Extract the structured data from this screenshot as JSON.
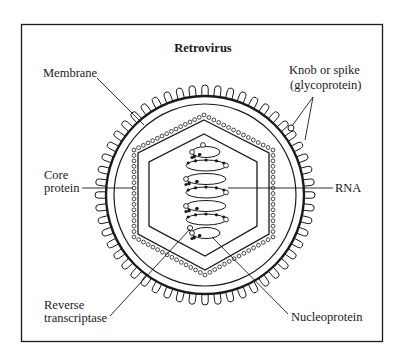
{
  "title": "Retrovirus",
  "labels": {
    "membrane": "Membrane",
    "knob_line1": "Knob or spike",
    "knob_line2": "(glycoprotein)",
    "core_line1": "Core",
    "core_line2": "protein",
    "rna": "RNA",
    "rt_line1": "Reverse",
    "rt_line2": "transcriptase",
    "nucleoprotein": "Nucleoprotein"
  },
  "colors": {
    "ink": "#1a1a1a",
    "background": "#ffffff"
  }
}
